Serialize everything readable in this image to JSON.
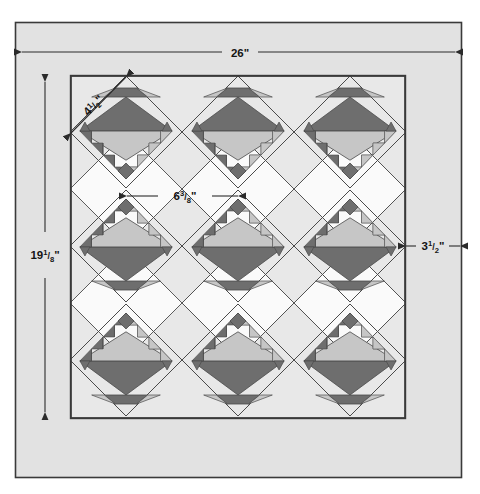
{
  "diagram": {
    "title": "Quilt Assembly Diagram",
    "type": "quilt-layout",
    "colors": {
      "page_background": "#ffffff",
      "outer_frame_fill": "#e2e2e2",
      "border_fill": "#e2e2e2",
      "quilt_field_fill": "#e8e8e8",
      "setting_square_fill": "#f7f7f7",
      "dark_fabric": "#6e6e6e",
      "light_fabric": "#c6c6c6",
      "outline": "#2b2b2b",
      "thin_outline": "#555555",
      "dimension_line": "#2b2b2b",
      "label_text": "#1a1a1a"
    },
    "frame": {
      "x": 15,
      "y": 22,
      "width": 447,
      "height": 456
    },
    "quilt": {
      "x": 70,
      "y": 75,
      "width": 336,
      "height": 344
    },
    "inner_field": {
      "x": 71,
      "y": 76,
      "width": 334,
      "height": 342
    },
    "border_lines": {
      "left_x": 71,
      "right_x": 405,
      "top_y": 76,
      "bottom_y": 418
    }
  },
  "dimensions": {
    "overall_width": {
      "label": "26\"",
      "value": 26,
      "unit": "in",
      "orientation": "horizontal"
    },
    "overall_height": {
      "label": "19",
      "fraction_num": "1",
      "fraction_den": "8",
      "suffix": "\"",
      "value": 19.125,
      "unit": "in",
      "orientation": "vertical"
    },
    "block_side": {
      "label": "4",
      "fraction_num": "1",
      "fraction_den": "2",
      "suffix": "\"",
      "value": 4.5,
      "unit": "in",
      "orientation": "diagonal"
    },
    "block_diagonal": {
      "label": "6",
      "fraction_num": "3",
      "fraction_den": "8",
      "suffix": "\"",
      "value": 6.375,
      "unit": "in",
      "orientation": "horizontal"
    },
    "border_width": {
      "label": "3",
      "fraction_num": "1",
      "fraction_den": "2",
      "suffix": "\"",
      "value": 3.5,
      "unit": "in",
      "orientation": "horizontal"
    }
  },
  "labels": {
    "width_26": "26\"",
    "height_19_1_8_whole": "19",
    "height_19_1_8_num": "1",
    "height_19_1_8_den": "8",
    "height_19_1_8_suffix": "\"",
    "block_4_1_2_whole": "4",
    "block_4_1_2_num": "1",
    "block_4_1_2_den": "2",
    "block_4_1_2_suffix": "\"",
    "diag_6_3_8_whole": "6",
    "diag_6_3_8_num": "3",
    "diag_6_3_8_den": "8",
    "diag_6_3_8_suffix": "\"",
    "border_3_1_2_whole": "3",
    "border_3_1_2_num": "1",
    "border_3_1_2_den": "2",
    "border_3_1_2_suffix": "\""
  },
  "layout": {
    "rows": 3,
    "columns": 3,
    "block_pitch_x": 112,
    "block_pitch_y": 114,
    "first_center_x": 126,
    "first_center_y": 132,
    "half_diagonal": 56,
    "orientation_by_row": [
      "down",
      "up",
      "up"
    ],
    "note": "On-point basket blocks set in a 3 x 3 grid with plain setting squares between."
  },
  "blocks": [
    {
      "row": 1,
      "col": 1,
      "cx": 126,
      "cy": 132,
      "orientation": "down"
    },
    {
      "row": 1,
      "col": 2,
      "cx": 238,
      "cy": 132,
      "orientation": "down"
    },
    {
      "row": 1,
      "col": 3,
      "cx": 350,
      "cy": 132,
      "orientation": "down"
    },
    {
      "row": 2,
      "col": 1,
      "cx": 126,
      "cy": 246,
      "orientation": "up"
    },
    {
      "row": 2,
      "col": 2,
      "cx": 238,
      "cy": 246,
      "orientation": "up"
    },
    {
      "row": 2,
      "col": 3,
      "cx": 350,
      "cy": 246,
      "orientation": "up"
    },
    {
      "row": 3,
      "col": 1,
      "cx": 126,
      "cy": 360,
      "orientation": "up"
    },
    {
      "row": 3,
      "col": 2,
      "cx": 238,
      "cy": 360,
      "orientation": "up"
    },
    {
      "row": 3,
      "col": 3,
      "cx": 350,
      "cy": 360,
      "orientation": "up"
    }
  ],
  "block_design": {
    "name": "sawtooth-basket-block",
    "components": [
      {
        "part": "large-dark-triangle",
        "fabric": "dark"
      },
      {
        "part": "large-light-triangle",
        "fabric": "light"
      },
      {
        "part": "sawtooth-edge-triangles",
        "fabric": "dark",
        "count_per_edge": 4
      },
      {
        "part": "corner-square",
        "fabric": "dark"
      },
      {
        "part": "foot-triangles",
        "fabric": "dark",
        "count": 2
      }
    ]
  }
}
